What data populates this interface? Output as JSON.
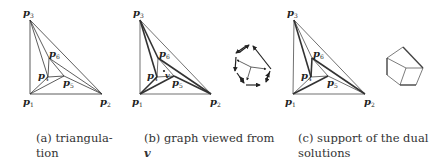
{
  "figure": {
    "panels": [
      {
        "id": "a",
        "caption_line1": "(a) triangula-",
        "caption_line2": "tion",
        "labels": {
          "p1": "p",
          "p2": "p",
          "p3": "p",
          "p4": "p",
          "p5": "p",
          "p6": "p"
        },
        "subscripts": {
          "p1": "1",
          "p2": "2",
          "p3": "3",
          "p4": "4",
          "p5": "5",
          "p6": "6"
        }
      },
      {
        "id": "b",
        "caption_line1": "(b) graph viewed from",
        "caption_line2": "v",
        "viewpoint_label": "v",
        "labels": {
          "p1": "p",
          "p2": "p",
          "p3": "p",
          "p4": "p",
          "p5": "p",
          "p6": "p"
        },
        "subscripts": {
          "p1": "1",
          "p2": "2",
          "p3": "3",
          "p4": "4",
          "p5": "5",
          "p6": "6"
        }
      },
      {
        "id": "c",
        "caption_line1": "(c) support of the dual",
        "caption_line2": "solutions",
        "labels": {
          "p1": "p",
          "p2": "p",
          "p3": "p",
          "p4": "p",
          "p5": "p",
          "p6": "p"
        },
        "subscripts": {
          "p1": "1",
          "p2": "2",
          "p3": "3",
          "p4": "4",
          "p5": "5",
          "p6": "6"
        }
      }
    ]
  }
}
